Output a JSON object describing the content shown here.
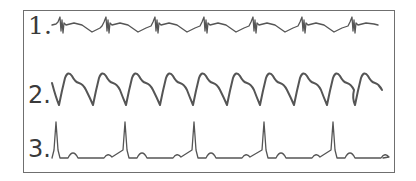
{
  "figure": {
    "traces": [
      {
        "label": "1.",
        "description": "low-amplitude trace with sharp biphasic spikes",
        "spike_x": [
          62,
          108,
          157,
          206,
          255,
          304,
          354
        ]
      },
      {
        "label": "2.",
        "description": "large sinusoidal wave with deep troughs",
        "trough_x": [
          59,
          93,
          126,
          160,
          193,
          227,
          260,
          294,
          327,
          355
        ]
      },
      {
        "label": "3.",
        "description": "tall narrow peaks with small secondary bumps",
        "peak_x": [
          56,
          125,
          194,
          264,
          333
        ]
      }
    ],
    "colors": {
      "trace": "#555555",
      "frame": "#6f6f6f",
      "text": "#3a3a3a",
      "background": "#ffffff"
    }
  }
}
